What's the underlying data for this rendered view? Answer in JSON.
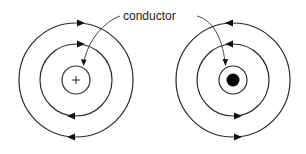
{
  "diagram": {
    "label": "conductor",
    "left_conductor": {
      "symbol": "+",
      "meaning": "current flowing out",
      "field_direction": "clockwise",
      "center": [
        76,
        80
      ],
      "radii": [
        14,
        36,
        57
      ]
    },
    "right_conductor": {
      "symbol": "dot",
      "field_direction": "counterclockwise",
      "center": [
        233,
        80
      ],
      "radii": [
        14,
        36,
        57
      ]
    },
    "colors": {
      "line": "#2a2a2a",
      "background": "#ffffff",
      "fill": "#000000"
    }
  }
}
